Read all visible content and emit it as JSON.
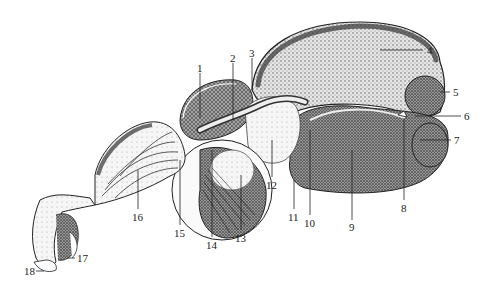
{
  "figure": {
    "type": "anatomical-diagram",
    "labels": [
      {
        "id": "1",
        "text": "1",
        "x": 197,
        "y": 63
      },
      {
        "id": "2",
        "text": "2",
        "x": 230,
        "y": 53
      },
      {
        "id": "3",
        "text": "3",
        "x": 249,
        "y": 48
      },
      {
        "id": "4",
        "text": "4",
        "x": 427,
        "y": 45
      },
      {
        "id": "5",
        "text": "5",
        "x": 453,
        "y": 87
      },
      {
        "id": "6",
        "text": "6",
        "x": 464,
        "y": 111
      },
      {
        "id": "7",
        "text": "7",
        "x": 454,
        "y": 135
      },
      {
        "id": "8",
        "text": "8",
        "x": 403,
        "y": 203
      },
      {
        "id": "9",
        "text": "9",
        "x": 350,
        "y": 222
      },
      {
        "id": "10",
        "text": "10",
        "x": 307,
        "y": 218
      },
      {
        "id": "11",
        "text": "11",
        "x": 290,
        "y": 212
      },
      {
        "id": "12",
        "text": "12",
        "x": 268,
        "y": 180
      },
      {
        "id": "13",
        "text": "13",
        "x": 237,
        "y": 233
      },
      {
        "id": "14",
        "text": "14",
        "x": 207,
        "y": 240
      },
      {
        "id": "15",
        "text": "15",
        "x": 176,
        "y": 228
      },
      {
        "id": "16",
        "text": "16",
        "x": 133,
        "y": 212
      },
      {
        "id": "17",
        "text": "17",
        "x": 77,
        "y": 255
      },
      {
        "id": "18",
        "text": "18",
        "x": 25,
        "y": 268
      }
    ]
  },
  "colors": {
    "background": "#ffffff",
    "ink": "#222222",
    "shade": "#555555",
    "light": "#bbbbbb"
  }
}
